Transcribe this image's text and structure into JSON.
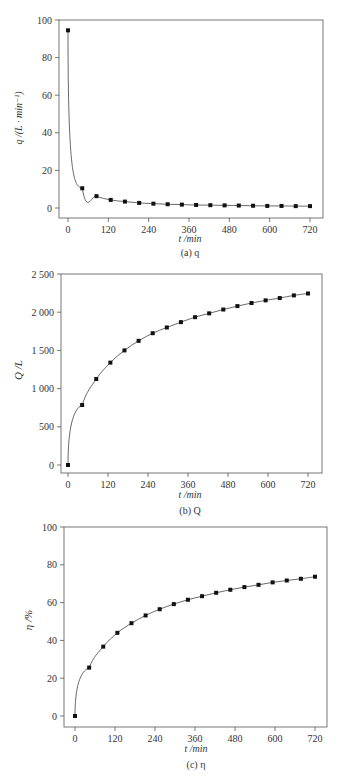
{
  "chart_data": [
    {
      "type": "line",
      "panel": "a",
      "caption": "(a) q",
      "xlabel": "t /min",
      "ylabel": "q /(L · min⁻¹)",
      "xlim": [
        0,
        720
      ],
      "ylim": [
        -3,
        100
      ],
      "xticks": [
        0,
        120,
        240,
        360,
        480,
        600,
        720
      ],
      "yticks": [
        0,
        20,
        40,
        60,
        80,
        100
      ],
      "ytick_labels": [
        "0",
        "20",
        "40",
        "60",
        "80",
        "100"
      ],
      "grid": false,
      "legend": null,
      "series": [
        {
          "name": "q",
          "marker": "square",
          "x": [
            0,
            42.4,
            84.7,
            127.1,
            169.4,
            211.8,
            254.1,
            296.5,
            338.8,
            381.2,
            423.5,
            465.9,
            508.2,
            550.6,
            592.9,
            635.3,
            677.6,
            720
          ],
          "values": [
            94.5,
            10.5,
            6.3,
            4.3,
            3.4,
            2.7,
            2.3,
            2.0,
            1.8,
            1.6,
            1.5,
            1.4,
            1.3,
            1.2,
            1.1,
            1.1,
            1.0,
            1.0
          ]
        }
      ]
    },
    {
      "type": "line",
      "panel": "b",
      "caption": "(b) Q",
      "xlabel": "t /min",
      "ylabel": "Q /L",
      "xlim": [
        0,
        720
      ],
      "ylim": [
        -100,
        2500
      ],
      "xticks": [
        0,
        120,
        240,
        360,
        480,
        600,
        720
      ],
      "yticks": [
        0,
        500,
        1000,
        1500,
        2000,
        2500
      ],
      "ytick_labels": [
        "0",
        "500",
        "1 000",
        "1 500",
        "2 000",
        "2 500"
      ],
      "grid": false,
      "legend": null,
      "series": [
        {
          "name": "Q",
          "marker": "square",
          "x": [
            0,
            42.4,
            84.7,
            127.1,
            169.4,
            211.8,
            254.1,
            296.5,
            338.8,
            381.2,
            423.5,
            465.9,
            508.2,
            550.6,
            592.9,
            635.3,
            677.6,
            720
          ],
          "values": [
            0,
            785,
            1125,
            1340,
            1500,
            1625,
            1725,
            1800,
            1870,
            1935,
            1985,
            2035,
            2080,
            2120,
            2155,
            2185,
            2220,
            2245
          ]
        }
      ]
    },
    {
      "type": "line",
      "panel": "c",
      "caption": "(c) η",
      "xlabel": "t /min",
      "ylabel": "η /%",
      "xlim": [
        0,
        720
      ],
      "ylim": [
        -5,
        100
      ],
      "xticks": [
        0,
        120,
        240,
        360,
        480,
        600,
        720
      ],
      "yticks": [
        0,
        20,
        40,
        60,
        80,
        100
      ],
      "ytick_labels": [
        "0",
        "20",
        "40",
        "60",
        "80",
        "100"
      ],
      "grid": false,
      "legend": null,
      "series": [
        {
          "name": "η",
          "marker": "square",
          "x": [
            0,
            42.4,
            84.7,
            127.1,
            169.4,
            211.8,
            254.1,
            296.5,
            338.8,
            381.2,
            423.5,
            465.9,
            508.2,
            550.6,
            592.9,
            635.3,
            677.6,
            720
          ],
          "values": [
            0,
            25.6,
            36.7,
            44.0,
            49.1,
            53.2,
            56.5,
            59.2,
            61.5,
            63.4,
            65.2,
            66.8,
            68.2,
            69.4,
            70.7,
            71.7,
            72.6,
            73.7
          ]
        }
      ]
    }
  ],
  "panels": [
    {
      "caption": "(a) q",
      "xlabel": "t /min",
      "ylabel": "q /(L · min⁻¹)"
    },
    {
      "caption": "(b) Q",
      "xlabel": "t /min",
      "ylabel": "Q /L"
    },
    {
      "caption": "(c) η",
      "xlabel": "t /min",
      "ylabel": "η /%"
    }
  ],
  "colors": {
    "line": "#444444",
    "marker": "#111111",
    "axis": "#555555",
    "text": "#333333"
  }
}
